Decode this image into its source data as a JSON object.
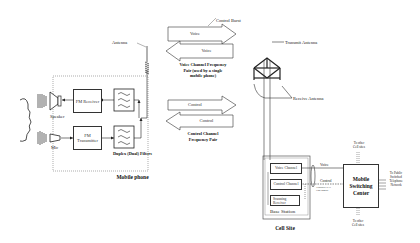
{
  "mobile_phone": {
    "title": "Mobile phone",
    "antenna_label": "Antenna",
    "speaker_label": "Speaker",
    "mic_label": "Mic",
    "fm_receiver": "FM Receiver",
    "fm_transmitter": "FM Transmitter",
    "duplex_filters": "Duplex (Dual) Filters"
  },
  "channels": {
    "control_burst": "Control Burst",
    "voice_up": "Voice",
    "voice_down": "Voice",
    "voice_pair_caption": "Voice Channel Frequency Pair (used by a single mobile phone)",
    "control_up": "Control",
    "control_down": "Control",
    "control_pair_caption": "Control Channel Frequency Pair"
  },
  "cell_site": {
    "title": "Cell Site",
    "transmit_antenna": "Transmit Antenna",
    "receive_antenna": "Receive Antenna",
    "base_station": "Base Station",
    "voice_channel": "Voice Channel",
    "control_channel": "Control Channel",
    "scanning_receiver": "Scanning Receiver",
    "voice_link": "Voice",
    "control_link": "Control",
    "link_note": "Typically a T1 Line/digital"
  },
  "msc": {
    "title": "Mobile Switching Center",
    "to_other_top": "To other Cell sites",
    "to_other_bottom": "To other Cell sites",
    "to_pstn": "To Public Switched Telephone Network"
  }
}
